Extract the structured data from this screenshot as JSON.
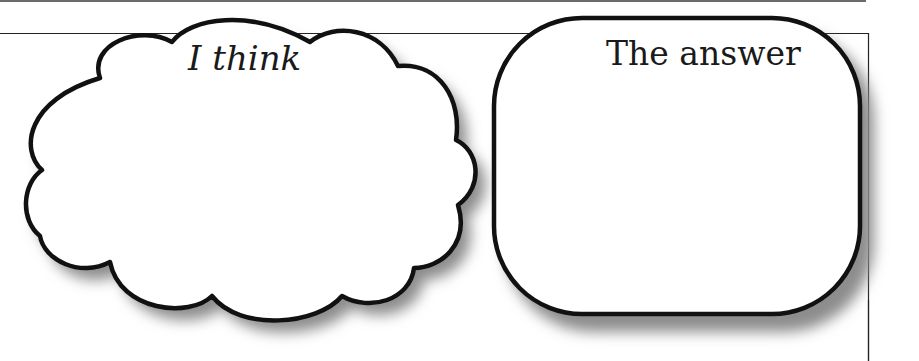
{
  "worksheet": {
    "think_bubble": {
      "label": "I think"
    },
    "answer_box": {
      "label": "The answer"
    }
  },
  "colors": {
    "outline": "#111111",
    "shadow": "#9a9a9a",
    "fill": "#ffffff",
    "top_rule": "#555555"
  }
}
